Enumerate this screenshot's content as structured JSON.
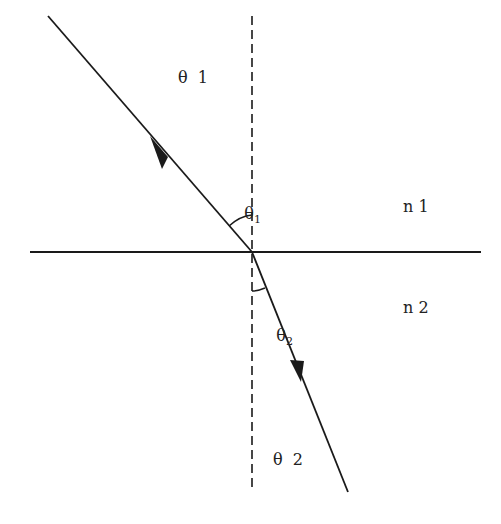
{
  "diagram": {
    "labels": {
      "incident_region_theta": "θ  1",
      "refracted_region_theta": "θ  2",
      "medium_1": "n 1",
      "medium_2": "n 2",
      "angle_1_symbol": "θ",
      "angle_1_sub": "1",
      "angle_2_symbol": "θ",
      "angle_2_sub": "2"
    },
    "colors": {
      "line": "#1a1a1a",
      "background": "#ffffff"
    }
  }
}
